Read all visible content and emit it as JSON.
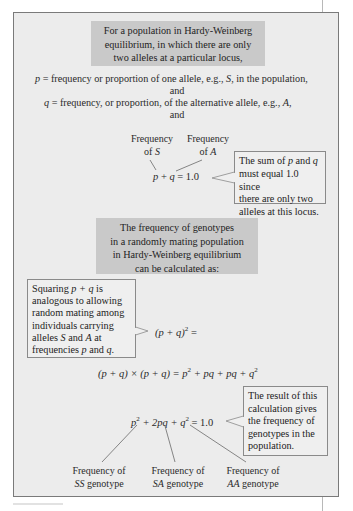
{
  "heading1": {
    "lines": [
      "For a population in Hardy-Weinberg",
      "equilibrium, in which there are only",
      "two alleles at a particular locus,"
    ]
  },
  "definitions": {
    "p_var": "p",
    "p_text": " = frequency or proportion of one allele, e.g., ",
    "p_allele": "S",
    "p_tail": ", in the population,",
    "and1": "and",
    "q_var": "q",
    "q_text": " = frequency, or proportion, of the alternative allele, e.g., ",
    "q_allele": "A",
    "q_tail": ",",
    "and2": "and"
  },
  "sum_section": {
    "label_s_line1": "Frequency",
    "label_s_line2_prefix": "of ",
    "label_s_allele": "S",
    "label_a_line1": "Frequency",
    "label_a_line2_prefix": "of ",
    "label_a_allele": "A",
    "formula_p": "p",
    "formula_mid": " + ",
    "formula_q": "q",
    "formula_tail": " = 1.0",
    "callout": {
      "line1_prefix": "The sum of ",
      "line1_p": "p",
      "line1_mid": " and ",
      "line1_q": "q",
      "line2": "must equal 1.0 since",
      "line3": "there are only two",
      "line4": "alleles at this locus."
    }
  },
  "heading2": {
    "lines": [
      "The frequency of genotypes",
      "in a randomly mating population",
      "in Hardy-Weinberg equilibrium",
      "can be calculated as:"
    ]
  },
  "squaring": {
    "callout": {
      "line1_prefix": "Squaring ",
      "line1_expr": "p + q",
      "line1_tail": " is",
      "line2": "analogous to allowing",
      "line3": "random mating among",
      "line4": "individuals carrying",
      "line5_prefix": "alleles ",
      "line5_s": "S",
      "line5_mid": " and ",
      "line5_a": "A",
      "line5_tail": " at",
      "line6_prefix": "frequencies ",
      "line6_p": "p",
      "line6_mid": " and ",
      "line6_q": "q",
      "line6_tail": "."
    },
    "formula_base": "(p + q)",
    "formula_exp": "2",
    "formula_tail": " ="
  },
  "expansion": {
    "lhs": "(p + q) × (p + q) = ",
    "t1": "p",
    "t1_exp": "2",
    "rest": " + pq + pq + ",
    "t4": "q",
    "t4_exp": "2"
  },
  "result": {
    "p": "p",
    "p_exp": "2",
    "mid": " + 2pq + ",
    "q": "q",
    "q_exp": "2",
    "tail": " = 1.0",
    "callout": {
      "line1": "The result of this",
      "line2": "calculation gives",
      "line3": "the frequency of",
      "line4": "genotypes in the",
      "line5": "population."
    },
    "labels": [
      {
        "line1": "Frequency of",
        "genotype": "SS",
        "suffix": " genotype"
      },
      {
        "line1": "Frequency of",
        "genotype": "SA",
        "suffix": " genotype"
      },
      {
        "line1": "Frequency of",
        "genotype": "AA",
        "suffix": " genotype"
      }
    ]
  }
}
